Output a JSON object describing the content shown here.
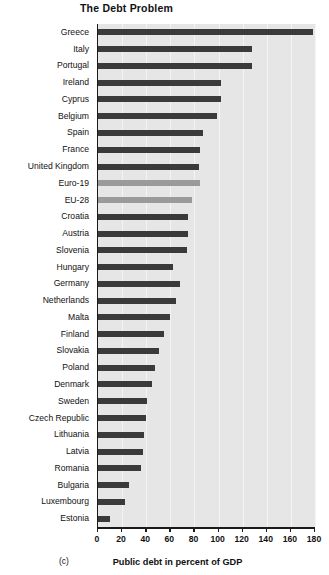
{
  "figure": {
    "title": "The Debt Problem",
    "panel_label": "(c)",
    "bar_color": "#3a3a3a",
    "aggregate_bar_color": "#9a9a9a",
    "plot_background": "#e6e6e6"
  },
  "chart_data": {
    "type": "bar",
    "orientation": "horizontal",
    "title": "The Debt Problem",
    "xlabel": "Public debt in percent of GDP",
    "ylabel": "",
    "xlim": [
      0,
      180
    ],
    "xticks": [
      0,
      20,
      40,
      60,
      80,
      100,
      120,
      140,
      160,
      180
    ],
    "grid": true,
    "legend": null,
    "categories": [
      "Greece",
      "Italy",
      "Portugal",
      "Ireland",
      "Cyprus",
      "Belgium",
      "Spain",
      "France",
      "United Kingdom",
      "Euro-19",
      "EU-28",
      "Croatia",
      "Austria",
      "Slovenia",
      "Hungary",
      "Germany",
      "Netherlands",
      "Malta",
      "Finland",
      "Slovakia",
      "Poland",
      "Denmark",
      "Sweden",
      "Czech Republic",
      "Lithuania",
      "Latvia",
      "Romania",
      "Bulgaria",
      "Luxembourg",
      "Estonia"
    ],
    "values": [
      178,
      128,
      128,
      102,
      102,
      99,
      87,
      85,
      84,
      85,
      78,
      75,
      75,
      74,
      62,
      68,
      65,
      60,
      55,
      51,
      47,
      45,
      41,
      40,
      38,
      37,
      36,
      26,
      22,
      10
    ],
    "series_kind": [
      "country",
      "country",
      "country",
      "country",
      "country",
      "country",
      "country",
      "country",
      "country",
      "aggregate",
      "aggregate",
      "country",
      "country",
      "country",
      "country",
      "country",
      "country",
      "country",
      "country",
      "country",
      "country",
      "country",
      "country",
      "country",
      "country",
      "country",
      "country",
      "country",
      "country",
      "country"
    ]
  }
}
